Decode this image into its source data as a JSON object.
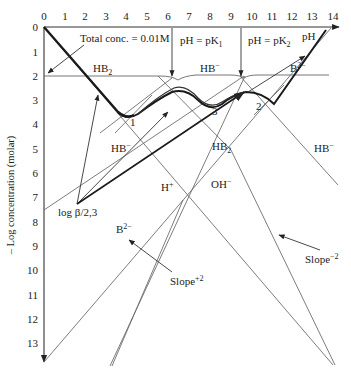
{
  "diagram": {
    "x_axis": {
      "label": "pH",
      "ticks": [
        "0",
        "1",
        "2",
        "3",
        "4",
        "5",
        "6",
        "7",
        "8",
        "9",
        "10",
        "11",
        "12",
        "13",
        "14"
      ]
    },
    "y_axis": {
      "label": "– Log concentration (molar)",
      "ticks": [
        "0",
        "1",
        "2",
        "3",
        "4",
        "5",
        "6",
        "7",
        "8",
        "9",
        "10",
        "11",
        "12",
        "13"
      ]
    },
    "annotations": {
      "total_conc": "Total conc. = 0.01M",
      "pk1": "pH = pK",
      "pk1_sub": "1",
      "pk2": "pH = pK",
      "pk2_sub": "2",
      "log_beta": "log β/2,3",
      "slope_neg": "Slope",
      "slope_neg_sup": "−2",
      "slope_pos": "Slope",
      "slope_pos_sup": "+2"
    },
    "species_labels": {
      "hb2_top": "HB",
      "hb2_top_sub": "2",
      "hb_minus_top": "HB",
      "hb_minus_top_sup": "−",
      "b2_top": "B",
      "b2_top_sup": "2−",
      "hb_minus_left": "HB",
      "hb_minus_left_sup": "−",
      "hb2_mid": "HB",
      "hb2_mid_sub": "2",
      "hb_minus_right": "HB",
      "hb_minus_right_sup": "−",
      "h_plus": "H",
      "h_plus_sup": "+",
      "oh_minus": "OH",
      "oh_minus_sup": "−",
      "b2_low": "B",
      "b2_low_sup": "2−"
    },
    "points": {
      "p1": "1",
      "p2": "2",
      "p3": "3"
    },
    "colors": {
      "thin_line": "#555555",
      "thick_line": "#1a1a1a",
      "text": "#222222"
    }
  }
}
